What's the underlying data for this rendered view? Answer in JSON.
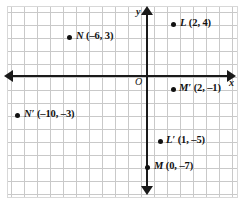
{
  "figure": {
    "type": "coordinate-plane",
    "axes": {
      "x_axis_label": "x",
      "y_axis_label": "y",
      "origin_label": "O"
    },
    "grid": {
      "visible": true,
      "cell_size_units": 1
    }
  },
  "chart_data": {
    "type": "scatter",
    "title": "",
    "xlabel": "x",
    "ylabel": "y",
    "grid": true,
    "legend": "none",
    "xlim": [
      -11,
      7
    ],
    "ylim": [
      -8,
      7
    ],
    "points": [
      {
        "name": "L",
        "label": "L (2, 4)",
        "x": 2,
        "y": 4
      },
      {
        "name": "N",
        "label": "N (–6, 3)",
        "x": -6,
        "y": 3
      },
      {
        "name": "M′",
        "label": "M′ (2, –1)",
        "x": 2,
        "y": -1
      },
      {
        "name": "N′",
        "label": "N′ (–10, –3)",
        "x": -10,
        "y": -3
      },
      {
        "name": "L′",
        "label": "L′ (1, –5)",
        "x": 1,
        "y": -5
      },
      {
        "name": "M",
        "label": "M (0, –7)",
        "x": 0,
        "y": -7
      }
    ]
  },
  "labels": {
    "L": {
      "name": "L",
      "coords": "(2, 4)"
    },
    "N": {
      "name": "N",
      "coords": "(–6, 3)"
    },
    "Mp": {
      "name": "M′",
      "coords": "(2, –1)"
    },
    "Np": {
      "name": "N′",
      "coords": "(–10, –3)"
    },
    "Lp": {
      "name": "L′",
      "coords": "(1, –5)"
    },
    "M": {
      "name": "M",
      "coords": "(0, –7)"
    }
  },
  "colors": {
    "axis": "#1a1a1a",
    "grid": "#c9c9c9",
    "point": "#111111",
    "background": "#ffffff"
  }
}
